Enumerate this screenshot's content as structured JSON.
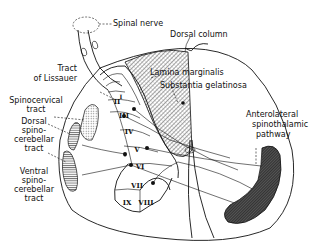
{
  "diagram": {
    "labels": {
      "spinal_nerve": "Spinal nerve",
      "dorsal_column": "Dorsal column",
      "tract_of_lissauer_1": "Tract",
      "tract_of_lissauer_2": "of Lissauer",
      "lamina_marginalis": "Lamina marginalis",
      "substantia_gelatinosa": "Substantia gelatinosa",
      "spinocervical_1": "Spinocervical",
      "spinocervical_2": "tract",
      "dorsal_spinocerebellar_1": "Dorsal",
      "dorsal_spinocerebellar_2": "spino-",
      "dorsal_spinocerebellar_3": "cerebellar",
      "dorsal_spinocerebellar_4": "tract",
      "ventral_spinocerebellar_1": "Ventral",
      "ventral_spinocerebellar_2": "spino-",
      "ventral_spinocerebellar_3": "cerebellar",
      "ventral_spinocerebellar_4": "tract",
      "anterolateral_1": "Anterolateral",
      "anterolateral_2": "spinothalamic",
      "anterolateral_3": "pathway"
    },
    "laminae": [
      "I",
      "II",
      "III",
      "IV",
      "V",
      "VI",
      "VII",
      "VIII",
      "IX"
    ],
    "colors": {
      "line": "#111111",
      "background": "#ffffff",
      "hatch_dark": "#333333"
    }
  }
}
